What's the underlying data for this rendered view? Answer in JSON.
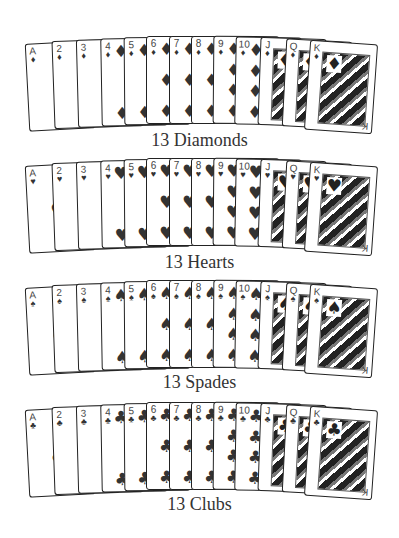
{
  "rows": [
    {
      "id": "diamonds",
      "label": "13 Diamonds",
      "symbol": "♦",
      "top": 36,
      "label_top": 130
    },
    {
      "id": "hearts",
      "label": "13 Hearts",
      "symbol": "♥",
      "top": 158,
      "label_top": 252
    },
    {
      "id": "spades",
      "label": "13 Spades",
      "symbol": "♠",
      "top": 280,
      "label_top": 372
    },
    {
      "id": "clubs",
      "label": "13 Clubs",
      "symbol": "♣",
      "top": 402,
      "label_top": 494
    }
  ],
  "ranks": [
    "A",
    "2",
    "3",
    "4",
    "5",
    "6",
    "7",
    "8",
    "9",
    "10",
    "J",
    "Q",
    "K"
  ],
  "card_lefts": [
    27,
    53,
    77,
    101,
    124,
    146,
    169,
    191,
    213,
    235,
    259,
    284,
    307
  ],
  "card_rot": [
    -3,
    -2,
    -1.5,
    -1,
    -0.5,
    0,
    0,
    0,
    0.5,
    1,
    2,
    3,
    4
  ],
  "card_dy": [
    6,
    4,
    3,
    2,
    1,
    0,
    0,
    0,
    0,
    1,
    2,
    4,
    6
  ]
}
